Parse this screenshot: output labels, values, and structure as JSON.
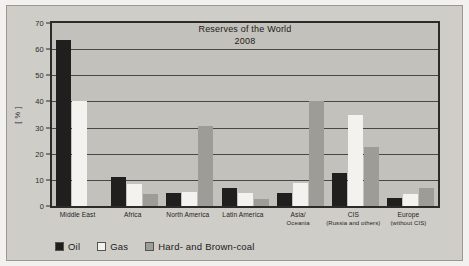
{
  "chart_data": {
    "type": "bar",
    "title": "Reserves of the World",
    "subtitle": "2008",
    "xlabel": "",
    "ylabel": "[ % ]",
    "ylim": [
      0,
      70
    ],
    "yticks": [
      0,
      10,
      20,
      30,
      40,
      50,
      60,
      70
    ],
    "grid": true,
    "legend_position": "bottom-left",
    "categories": [
      "Middle East",
      "Africa",
      "North America",
      "Latin America",
      "Asia/",
      "CIS",
      "Europe"
    ],
    "category_sublabels": [
      "",
      "",
      "",
      "",
      "Oceania",
      "(Russia and others)",
      "(without CIS)"
    ],
    "series": [
      {
        "name": "Oil",
        "color": "#201f1e",
        "values": [
          63.5,
          11.0,
          5.0,
          7.0,
          5.0,
          12.5,
          3.0
        ]
      },
      {
        "name": "Gas",
        "color": "#f3f2ee",
        "values": [
          40.0,
          8.5,
          5.5,
          5.0,
          8.8,
          35.0,
          4.5
        ]
      },
      {
        "name": "Hard- and Brown-coal",
        "color": "#9e9c97",
        "values": [
          0.0,
          4.5,
          30.5,
          2.5,
          40.0,
          22.5,
          7.0
        ]
      }
    ]
  },
  "legend": {
    "items": [
      {
        "label": "Oil",
        "color": "#201f1e"
      },
      {
        "label": "Gas",
        "color": "#f3f2ee"
      },
      {
        "label": "Hard- and Brown-coal",
        "color": "#9e9c97"
      }
    ]
  }
}
